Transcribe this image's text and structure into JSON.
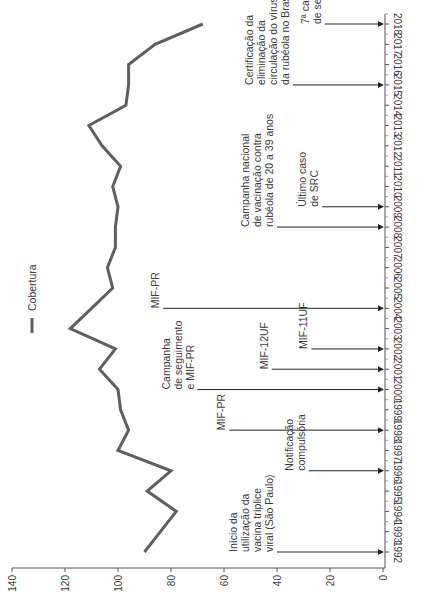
{
  "chart_data": {
    "type": "line",
    "orientation": "rotated-90-clockwise",
    "title": "",
    "xlabel": "",
    "ylabel": "",
    "ylim": [
      0,
      140
    ],
    "yticks": [
      0,
      20,
      40,
      60,
      80,
      100,
      120,
      140
    ],
    "categories": [
      "1992",
      "1993",
      "1994",
      "1995",
      "1996",
      "1997",
      "1998",
      "1999",
      "2000",
      "2001",
      "2002",
      "2003",
      "2004",
      "2005",
      "2006",
      "2007",
      "2008",
      "2009",
      "2010",
      "2011",
      "2012",
      "2013",
      "2014",
      "2015",
      "2016",
      "2017",
      "2018"
    ],
    "series": [
      {
        "name": "Cobertura",
        "color": "#5f5f5f",
        "values": [
          90,
          84,
          78,
          89,
          80,
          100,
          96,
          99,
          100,
          107,
          101,
          118,
          110,
          102,
          104,
          101,
          101,
          100,
          102,
          99,
          106,
          111,
          97,
          96,
          96,
          86,
          68
        ]
      }
    ],
    "legend": {
      "label": "Cobertura",
      "position": "inside-left"
    },
    "grid": false,
    "annotations": [
      {
        "year": "1992",
        "lines": [
          "Início da",
          "utilização da",
          "vacina tríplice",
          "viral (São Paulo)"
        ],
        "arrow_from": 40
      },
      {
        "year": "1996",
        "lines": [
          "Notificação",
          "compulsória"
        ],
        "arrow_from": 28
      },
      {
        "year": "1998",
        "lines": [
          "MIF-PR"
        ],
        "arrow_from": 58
      },
      {
        "year": "2000",
        "lines": [
          "Campanha",
          "de seguimento",
          "e MIF-PR"
        ],
        "arrow_from": 70
      },
      {
        "year": "2001",
        "lines": [
          "MIF-12UF"
        ],
        "arrow_from": 42
      },
      {
        "year": "2002",
        "lines": [
          "MIF-11UF"
        ],
        "arrow_from": 27
      },
      {
        "year": "2004",
        "lines": [
          "MIF-PR"
        ],
        "arrow_from": 83
      },
      {
        "year": "2008",
        "lines": [
          "Campanha nacional",
          "de vacinação contra",
          "rubéola de 20 a 39 anos"
        ],
        "arrow_from": 40
      },
      {
        "year": "2009",
        "lines": [
          "Último caso",
          "de SRC"
        ],
        "arrow_from": 23
      },
      {
        "year": "2015",
        "lines": [
          "Certificação da",
          "eliminação da",
          "circulação do vírus",
          "da rubéola no Brasil"
        ],
        "arrow_from": 34
      },
      {
        "year": "2018",
        "lines": [
          "7ª campanha",
          "de seguimento"
        ],
        "arrow_from": 22
      }
    ]
  }
}
